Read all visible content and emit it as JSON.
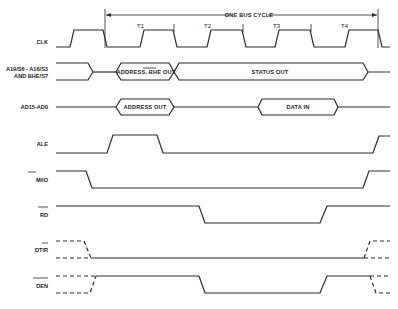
{
  "title": "ONE BUS CYCLE",
  "states": [
    "T1",
    "T2",
    "T3",
    "T4"
  ],
  "signals": [
    {
      "id": "clk",
      "label": "CLK"
    },
    {
      "id": "addr",
      "label_line1": "A19/S6 - A16/S3",
      "label_line2": "AND BHE/S7"
    },
    {
      "id": "ad",
      "label": "AD15-AD0"
    },
    {
      "id": "ale",
      "label": "ALE"
    },
    {
      "id": "mio",
      "label": "M/IO"
    },
    {
      "id": "rd",
      "label": "RD"
    },
    {
      "id": "dtr",
      "label": "DT/R"
    },
    {
      "id": "den",
      "label": "DEN"
    }
  ],
  "bus_labels": {
    "address_bhe_out": "ADDRESS, BHE OUT",
    "status_out": "STATUS OUT",
    "address_out": "ADDRESS OUT",
    "data_in": "DATA IN"
  },
  "colors": {
    "line": "#2a2a2a",
    "background": "#ffffff"
  }
}
